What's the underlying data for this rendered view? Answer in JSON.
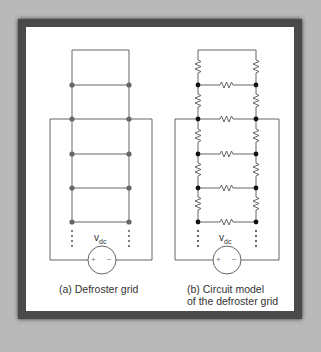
{
  "figure": {
    "panels": [
      {
        "id": "a",
        "caption": "(a) Defroster grid",
        "source_label": "v",
        "source_subscript": "dc",
        "source_plus": "+",
        "source_minus": "−",
        "ellipsis": "⋮"
      },
      {
        "id": "b",
        "caption_line1": "(b) Circuit model",
        "caption_line2": "of the defroster grid",
        "source_label": "v",
        "source_subscript": "dc",
        "source_plus": "+",
        "source_minus": "−",
        "ellipsis": "⋮"
      }
    ],
    "colors": {
      "background": "#b9b9b9",
      "frame": "#4a4a4a",
      "panel": "#ffffff",
      "line": "#555555",
      "node_a": "#666666",
      "node_b": "#111111"
    }
  }
}
